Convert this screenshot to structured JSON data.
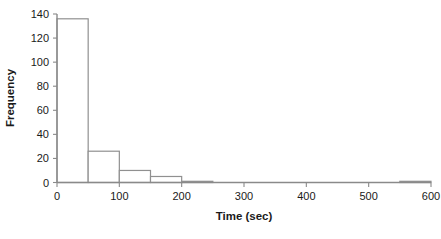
{
  "chart_data": {
    "type": "bar",
    "subtype": "histogram",
    "title": "",
    "xlabel": "Time (sec)",
    "ylabel": "Frequency",
    "xlim": [
      0,
      600
    ],
    "ylim": [
      0,
      140
    ],
    "grid": false,
    "legend": null,
    "bin_width": 50,
    "bin_edges": [
      0,
      50,
      100,
      150,
      200,
      250,
      300,
      350,
      400,
      450,
      500,
      550,
      600
    ],
    "categories": [
      "0-50",
      "50-100",
      "100-150",
      "150-200",
      "200-250",
      "250-300",
      "300-350",
      "350-400",
      "400-450",
      "450-500",
      "500-550",
      "550-600"
    ],
    "values": [
      136,
      26,
      10,
      5,
      1,
      0,
      0,
      0,
      0,
      0,
      0,
      1
    ],
    "xticks": [
      0,
      100,
      200,
      300,
      400,
      500,
      600
    ],
    "xtick_labels": [
      "0",
      "100",
      "200",
      "300",
      "400",
      "500",
      "600"
    ],
    "yticks": [
      0,
      20,
      40,
      60,
      80,
      100,
      120,
      140
    ],
    "ytick_labels": [
      "0",
      "20",
      "40",
      "60",
      "80",
      "100",
      "120",
      "140"
    ],
    "colors": {
      "bar_fill": "#ffffff",
      "bar_stroke": "#909090",
      "axis": "#8a8a8a",
      "text": "#1a1a1a",
      "background": "#ffffff"
    }
  }
}
